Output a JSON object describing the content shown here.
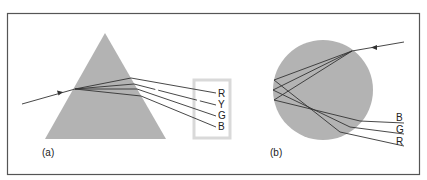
{
  "figure": {
    "panels": [
      {
        "id": "a",
        "caption": "(a)",
        "shape": "triangular prism",
        "output_labels": [
          "R",
          "Y",
          "G",
          "B"
        ]
      },
      {
        "id": "b",
        "caption": "(b)",
        "shape": "spherical water droplet",
        "output_labels": [
          "B",
          "G",
          "R"
        ]
      }
    ]
  },
  "colors": {
    "frame": "#555555",
    "shape_fill": "#b3b3b3",
    "label_box": "#d9d9d9",
    "ray": "#333333",
    "background": "#ffffff"
  }
}
